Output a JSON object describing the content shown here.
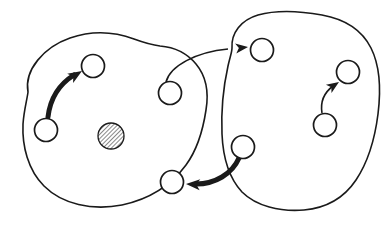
{
  "canvas": {
    "width": 391,
    "height": 227,
    "background_color": "#ffffff",
    "ink_color": "#1a1a1a"
  },
  "diagram": {
    "type": "hand-drawn-state-transition-diagram",
    "regions": [
      {
        "id": "region-left",
        "name": "left-region",
        "label": "",
        "stroke_width": 1.6,
        "path": "M 28 92 C 24 70, 44 47, 70 38 C 96 29, 118 33, 134 39 C 145 43, 152 45, 160 46 C 172 47, 186 52, 196 64 C 206 76, 209 92, 206 110 C 203 130, 197 150, 186 165 C 172 184, 150 199, 122 205 C 92 211, 62 204, 44 186 C 28 170, 22 146, 23 124 C 24 110, 27 100, 28 92 Z"
      },
      {
        "id": "region-right",
        "name": "right-region",
        "label": "",
        "stroke_width": 1.6,
        "path": "M 232 48 C 231 33, 241 20, 258 15 C 276 10, 300 11, 322 15 C 344 19, 362 30, 371 48 C 380 66, 381 90, 378 114 C 375 138, 368 162, 356 180 C 344 198, 326 208, 304 210 C 280 212, 256 206, 242 192 C 229 178, 223 158, 222 134 C 221 110, 224 84, 228 66 C 230 57, 232 52, 232 48 Z"
      }
    ],
    "nodes": [
      {
        "id": "n1",
        "name": "node-left-upper",
        "region": "region-left",
        "cx": 93,
        "cy": 66,
        "r": 11.5,
        "fill": "white",
        "label": ""
      },
      {
        "id": "n2",
        "name": "node-left-lower",
        "region": "region-left",
        "cx": 46,
        "cy": 130,
        "r": 11.5,
        "fill": "white",
        "label": ""
      },
      {
        "id": "n3",
        "name": "node-left-middle",
        "region": "region-left",
        "cx": 170,
        "cy": 93,
        "r": 11.5,
        "fill": "white",
        "label": ""
      },
      {
        "id": "n4",
        "name": "node-left-bottom",
        "region": "region-left",
        "cx": 172,
        "cy": 182,
        "r": 11.5,
        "fill": "white",
        "label": ""
      },
      {
        "id": "n5",
        "name": "node-left-hatched",
        "region": "region-left",
        "cx": 111,
        "cy": 136,
        "r": 13.0,
        "fill": "hatched",
        "label": ""
      },
      {
        "id": "n6",
        "name": "node-right-top",
        "region": "region-right",
        "cx": 262,
        "cy": 50,
        "r": 11.5,
        "fill": "white",
        "label": ""
      },
      {
        "id": "n7",
        "name": "node-right-upper",
        "region": "region-right",
        "cx": 348,
        "cy": 72,
        "r": 11.5,
        "fill": "white",
        "label": ""
      },
      {
        "id": "n8",
        "name": "node-right-lower",
        "region": "region-right",
        "cx": 325,
        "cy": 125,
        "r": 11.5,
        "fill": "white",
        "label": ""
      },
      {
        "id": "n9",
        "name": "node-right-left",
        "region": "region-right",
        "cx": 243,
        "cy": 147,
        "r": 11.5,
        "fill": "white",
        "label": ""
      }
    ],
    "edges": [
      {
        "id": "e1",
        "name": "edge-left-lower-to-left-upper",
        "from": "n2",
        "to": "n1",
        "style": "thick",
        "stroke_width": 5.0,
        "scope": "intra-region",
        "path": "M 48 117 C 50 100, 58 85, 74 75",
        "arrow": {
          "tip_x": 82,
          "tip_y": 71,
          "angle": -32,
          "size": 9
        }
      },
      {
        "id": "e2",
        "name": "edge-left-middle-to-right-top",
        "from": "n3",
        "to": "n6",
        "style": "thin",
        "stroke_width": 1.6,
        "scope": "inter-region",
        "path": "M 166 82 C 170 66, 196 52, 228 49",
        "arrow": {
          "tip_x": 248,
          "tip_y": 47,
          "angle": -7,
          "size": 8
        }
      },
      {
        "id": "e3",
        "name": "edge-right-lower-to-right-upper",
        "from": "n8",
        "to": "n7",
        "style": "thin",
        "stroke_width": 1.6,
        "scope": "intra-region",
        "path": "M 322 113 C 320 101, 325 92, 333 86",
        "arrow": {
          "tip_x": 339,
          "tip_y": 82,
          "angle": -34,
          "size": 8
        }
      },
      {
        "id": "e4",
        "name": "edge-right-left-to-left-bottom",
        "from": "n9",
        "to": "n4",
        "style": "thick",
        "stroke_width": 5.0,
        "scope": "inter-region",
        "path": "M 239 158 C 232 174, 215 184, 196 184",
        "arrow": {
          "tip_x": 186,
          "tip_y": 184,
          "angle": 183,
          "size": 9
        }
      }
    ],
    "hatching": {
      "name": "diagonal-hatch-pattern",
      "angle_deg": 45,
      "spacing_px": 3,
      "stroke_width": 1.1,
      "color": "#262626"
    }
  }
}
